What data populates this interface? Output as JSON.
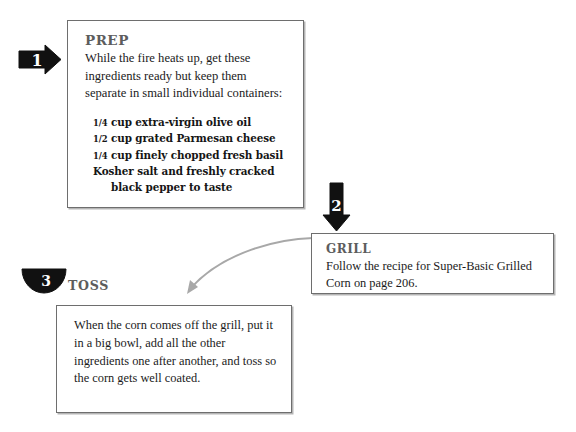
{
  "page": {
    "background_color": "#ffffff",
    "width": 576,
    "height": 432
  },
  "theme": {
    "heading_color": "#5d5d5d",
    "body_text_color": "#1b1b1b",
    "box_border_color": "#6e6e6e",
    "marker_fill_color": "#111111",
    "marker_number_color": "#ffffff",
    "connector_color": "#a8a8a8"
  },
  "steps": [
    {
      "number": "1",
      "marker_shape": "right-arrow",
      "heading": "PREP",
      "body": "While the fire heats up, get these ingredients ready but keep them separate in small individual containers:",
      "ingredients": [
        {
          "fraction": "1/4",
          "numerator": "1",
          "denominator": "4",
          "text": "cup extra-virgin olive oil",
          "indent": false
        },
        {
          "fraction": "1/2",
          "numerator": "1",
          "denominator": "2",
          "text": "cup grated Parmesan cheese",
          "indent": false
        },
        {
          "fraction": "1/4",
          "numerator": "1",
          "denominator": "4",
          "text": "cup finely chopped fresh basil",
          "indent": false
        },
        {
          "fraction": "",
          "numerator": "",
          "denominator": "",
          "text": "Kosher salt and freshly cracked",
          "indent": false
        },
        {
          "fraction": "",
          "numerator": "",
          "denominator": "",
          "text": "black pepper to taste",
          "indent": true
        }
      ]
    },
    {
      "number": "2",
      "marker_shape": "down-arrow",
      "heading": "GRILL",
      "body": "Follow the recipe for Super-Basic Grilled Corn on page 206."
    },
    {
      "number": "3",
      "marker_shape": "half-circle-down",
      "heading": "TOSS",
      "body": "When the corn comes off the grill, put it in a big bowl, add all the other ingredients one after another, and toss so the corn gets well coated."
    }
  ],
  "connector": {
    "from": "grill-box",
    "to": "toss-box",
    "style": "curved-arrow"
  }
}
